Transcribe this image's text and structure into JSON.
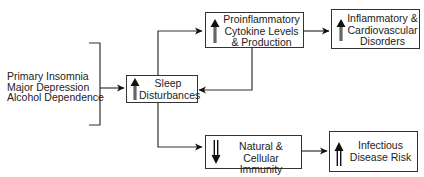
{
  "causes": [
    "Primary Insomnia",
    "Major Depression",
    "Alcohol Dependence"
  ],
  "nodes": {
    "sleep": {
      "lines": [
        "Sleep",
        "Disturbances"
      ],
      "direction": "up"
    },
    "cytokine": {
      "lines": [
        "Proinflammatory",
        "Cytokine Levels",
        "& Production"
      ],
      "direction": "up"
    },
    "inflammatory": {
      "lines": [
        "Inflammatory &",
        "Cardiovascular",
        "Disorders"
      ],
      "direction": "up"
    },
    "immunity": {
      "lines": [
        "Natural &",
        "Cellular Immunity"
      ],
      "direction": "down"
    },
    "infectious": {
      "lines": [
        "Infectious",
        "Disease Risk"
      ],
      "direction": "up"
    }
  },
  "colors": {
    "line": "#333333",
    "arrow": "#111111",
    "text": "#222222"
  }
}
